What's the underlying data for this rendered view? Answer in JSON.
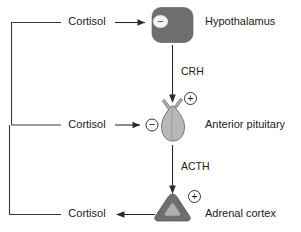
{
  "diagram": {
    "colors": {
      "hypothalamus_fill": "#6e6e6e",
      "pituitary_fill": "#b8b8b8",
      "pituitary_stroke": "#6a6a6a",
      "adrenal_fill": "#6e6e6e",
      "adrenal_inner_fill": "#aeaeae",
      "line": "#2b2b2b",
      "text": "#1a1a1a",
      "background": "#ffffff"
    },
    "nodes": [
      {
        "id": "hypothalamus",
        "label": "Hypothalamus",
        "shape": "rounded-rectangle",
        "sign": "−",
        "sign_type": "negative"
      },
      {
        "id": "anterior-pituitary",
        "label": "Anterior pituitary",
        "shape": "gland-gourd",
        "sign": "−",
        "sign_type": "negative",
        "stimulatory_sign": "+"
      },
      {
        "id": "adrenal-cortex",
        "label": "Adrenal cortex",
        "shape": "rounded-triangle",
        "sign": "+",
        "sign_type": "positive"
      }
    ],
    "hormones": [
      {
        "id": "crh",
        "label": "CRH",
        "from": "hypothalamus",
        "to": "anterior-pituitary"
      },
      {
        "id": "acth",
        "label": "ACTH",
        "from": "anterior-pituitary",
        "to": "adrenal-cortex"
      }
    ],
    "feedback": [
      {
        "id": "cortisol-to-hypothalamus",
        "label": "Cortisol",
        "target": "hypothalamus",
        "effect": "inhibition"
      },
      {
        "id": "cortisol-to-pituitary",
        "label": "Cortisol",
        "target": "anterior-pituitary",
        "effect": "inhibition"
      },
      {
        "id": "cortisol-output",
        "label": "Cortisol",
        "source": "adrenal-cortex",
        "effect": "secretion"
      }
    ],
    "signs": {
      "minus": "−",
      "plus": "+"
    }
  }
}
